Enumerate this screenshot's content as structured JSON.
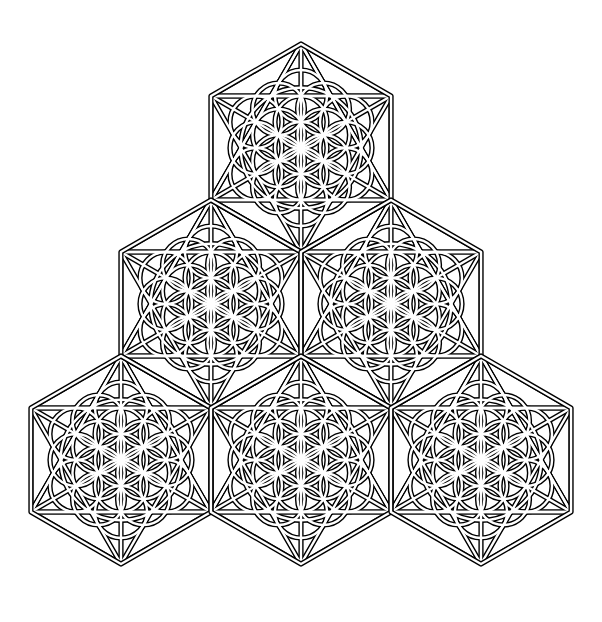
{
  "canvas": {
    "width": 602,
    "height": 622,
    "background": "#ffffff"
  },
  "style": {
    "ink": "#000000",
    "paper": "#ffffff",
    "band_outer": 5.2,
    "band_inner": 2.4
  },
  "hexagon": {
    "radius": 104,
    "orientation": "pointy-top"
  },
  "tiles": [
    {
      "id": "top",
      "cx": 301,
      "cy": 148
    },
    {
      "id": "middle-left",
      "cx": 211,
      "cy": 304
    },
    {
      "id": "middle-right",
      "cx": 391,
      "cy": 304
    },
    {
      "id": "bottom-left",
      "cx": 121,
      "cy": 460
    },
    {
      "id": "bottom-center",
      "cx": 301,
      "cy": 460
    },
    {
      "id": "bottom-right",
      "cx": 481,
      "cy": 460
    }
  ],
  "pattern": {
    "hexagram": true,
    "inner_hexagon_chords": true,
    "spokes": true,
    "flower_circle_radius_ratio": 0.25,
    "flower_rings": 2,
    "outer_circle_ratio": 0.58
  }
}
